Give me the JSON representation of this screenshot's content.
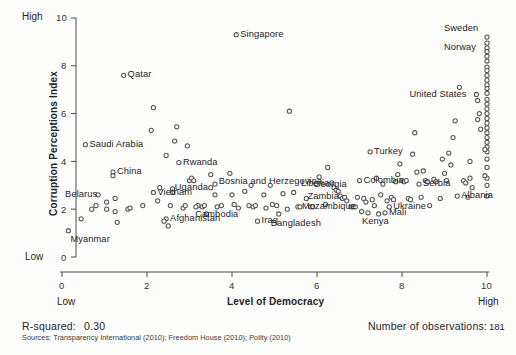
{
  "chart_data": {
    "type": "scatter",
    "title": "",
    "xlabel": "Level of Democracy",
    "ylabel": "Corruption Perceptions Index",
    "xlim": [
      0,
      10
    ],
    "ylim": [
      0,
      10
    ],
    "xticks": [
      "0",
      "2",
      "4",
      "6",
      "8",
      "10"
    ],
    "yticks": [
      "0",
      "2",
      "4",
      "6",
      "8",
      "10"
    ],
    "x_low_label": "Low",
    "x_high_label": "High",
    "y_low_label": "Low",
    "y_high_label": "High",
    "grid": false,
    "legend": "none",
    "r_squared": "0.30",
    "n_observations": "181",
    "points": [
      {
        "x": 0.15,
        "y": 1.1,
        "label": "Myanmar",
        "label_pos": "below-right"
      },
      {
        "x": 0.45,
        "y": 1.6,
        "label": ""
      },
      {
        "x": 0.55,
        "y": 4.7,
        "label": "Saudi Arabia",
        "label_pos": "right"
      },
      {
        "x": 0.85,
        "y": 2.6,
        "label": "Belarus",
        "label_pos": "below-left"
      },
      {
        "x": 0.8,
        "y": 2.15,
        "label": ""
      },
      {
        "x": 0.7,
        "y": 2.0,
        "label": ""
      },
      {
        "x": 1.05,
        "y": 2.3,
        "label": ""
      },
      {
        "x": 1.05,
        "y": 2.0,
        "label": ""
      },
      {
        "x": 1.2,
        "y": 3.55,
        "label": "China",
        "label_pos": "right"
      },
      {
        "x": 1.2,
        "y": 3.4,
        "label": ""
      },
      {
        "x": 1.25,
        "y": 2.45,
        "label": ""
      },
      {
        "x": 1.25,
        "y": 1.9,
        "label": ""
      },
      {
        "x": 1.3,
        "y": 1.45,
        "label": ""
      },
      {
        "x": 1.45,
        "y": 7.6,
        "label": "Qatar",
        "label_pos": "right"
      },
      {
        "x": 1.55,
        "y": 2.0,
        "label": ""
      },
      {
        "x": 1.6,
        "y": 2.05,
        "label": ""
      },
      {
        "x": 1.9,
        "y": 2.15,
        "label": ""
      },
      {
        "x": 2.15,
        "y": 6.25,
        "label": ""
      },
      {
        "x": 2.1,
        "y": 5.3,
        "label": ""
      },
      {
        "x": 2.15,
        "y": 2.7,
        "label": "Vietnam",
        "label_pos": "right"
      },
      {
        "x": 2.25,
        "y": 2.35,
        "label": ""
      },
      {
        "x": 2.45,
        "y": 1.6,
        "label": "Afghanistan",
        "label_pos": "right"
      },
      {
        "x": 2.4,
        "y": 1.5,
        "label": ""
      },
      {
        "x": 2.5,
        "y": 1.3,
        "label": ""
      },
      {
        "x": 2.55,
        "y": 2.15,
        "label": ""
      },
      {
        "x": 2.6,
        "y": 2.85,
        "label": ""
      },
      {
        "x": 2.6,
        "y": 2.7,
        "label": ""
      },
      {
        "x": 2.45,
        "y": 4.25,
        "label": ""
      },
      {
        "x": 2.65,
        "y": 4.85,
        "label": ""
      },
      {
        "x": 2.7,
        "y": 5.45,
        "label": ""
      },
      {
        "x": 2.75,
        "y": 3.95,
        "label": "Rwanda",
        "label_pos": "right"
      },
      {
        "x": 2.85,
        "y": 2.05,
        "label": ""
      },
      {
        "x": 2.9,
        "y": 2.15,
        "label": ""
      },
      {
        "x": 2.95,
        "y": 4.65,
        "label": ""
      },
      {
        "x": 3.0,
        "y": 3.2,
        "label": ""
      },
      {
        "x": 3.05,
        "y": 3.3,
        "label": ""
      },
      {
        "x": 3.1,
        "y": 3.2,
        "label": ""
      },
      {
        "x": 3.2,
        "y": 2.15,
        "label": ""
      },
      {
        "x": 3.15,
        "y": 2.1,
        "label": ""
      },
      {
        "x": 3.3,
        "y": 2.1,
        "label": "Cambodia",
        "label_pos": "below"
      },
      {
        "x": 3.35,
        "y": 2.15,
        "label": ""
      },
      {
        "x": 3.4,
        "y": 1.8,
        "label": ""
      },
      {
        "x": 3.5,
        "y": 2.9,
        "label": "Uganda",
        "label_pos": "left"
      },
      {
        "x": 3.6,
        "y": 3.05,
        "label": ""
      },
      {
        "x": 3.6,
        "y": 2.6,
        "label": ""
      },
      {
        "x": 3.65,
        "y": 2.1,
        "label": ""
      },
      {
        "x": 3.75,
        "y": 2.15,
        "label": ""
      },
      {
        "x": 4.1,
        "y": 9.3,
        "label": "Singapore",
        "label_pos": "right"
      },
      {
        "x": 3.95,
        "y": 3.5,
        "label": ""
      },
      {
        "x": 3.5,
        "y": 3.45,
        "label": "Bosnia and Herzegovina",
        "label_pos": "right-far"
      },
      {
        "x": 4.0,
        "y": 2.6,
        "label": ""
      },
      {
        "x": 4.05,
        "y": 2.2,
        "label": ""
      },
      {
        "x": 4.15,
        "y": 2.05,
        "label": ""
      },
      {
        "x": 4.3,
        "y": 2.75,
        "label": ""
      },
      {
        "x": 4.4,
        "y": 2.15,
        "label": ""
      },
      {
        "x": 4.5,
        "y": 2.1,
        "label": ""
      },
      {
        "x": 4.55,
        "y": 2.15,
        "label": ""
      },
      {
        "x": 4.6,
        "y": 1.5,
        "label": "Iraq",
        "label_pos": "right"
      },
      {
        "x": 4.75,
        "y": 2.6,
        "label": ""
      },
      {
        "x": 4.8,
        "y": 2.05,
        "label": ""
      },
      {
        "x": 4.95,
        "y": 2.2,
        "label": ""
      },
      {
        "x": 5.05,
        "y": 2.15,
        "label": ""
      },
      {
        "x": 5.1,
        "y": 1.8,
        "label": "Bangladesh",
        "label_pos": "below-right"
      },
      {
        "x": 5.2,
        "y": 2.65,
        "label": ""
      },
      {
        "x": 5.35,
        "y": 6.1,
        "label": ""
      },
      {
        "x": 5.45,
        "y": 2.7,
        "label": ""
      },
      {
        "x": 5.55,
        "y": 2.1,
        "label": "Mozambique",
        "label_pos": "right"
      },
      {
        "x": 5.6,
        "y": 2.1,
        "label": ""
      },
      {
        "x": 5.85,
        "y": 2.1,
        "label": ""
      },
      {
        "x": 5.9,
        "y": 2.1,
        "label": ""
      },
      {
        "x": 6.05,
        "y": 3.35,
        "label": "Georgia",
        "label_pos": "below-left"
      },
      {
        "x": 6.25,
        "y": 3.75,
        "label": ""
      },
      {
        "x": 6.35,
        "y": 3.1,
        "label": "Liberia",
        "label_pos": "left"
      },
      {
        "x": 6.4,
        "y": 2.9,
        "label": ""
      },
      {
        "x": 6.45,
        "y": 2.8,
        "label": ""
      },
      {
        "x": 6.5,
        "y": 2.75,
        "label": ""
      },
      {
        "x": 6.55,
        "y": 2.55,
        "label": "Zambia",
        "label_pos": "left"
      },
      {
        "x": 6.6,
        "y": 2.45,
        "label": ""
      },
      {
        "x": 6.65,
        "y": 2.5,
        "label": ""
      },
      {
        "x": 6.7,
        "y": 2.35,
        "label": ""
      },
      {
        "x": 6.8,
        "y": 2.1,
        "label": ""
      },
      {
        "x": 6.85,
        "y": 2.1,
        "label": ""
      },
      {
        "x": 6.9,
        "y": 2.1,
        "label": ""
      },
      {
        "x": 7.0,
        "y": 3.2,
        "label": "Colombia",
        "label_pos": "right"
      },
      {
        "x": 6.95,
        "y": 2.5,
        "label": ""
      },
      {
        "x": 7.1,
        "y": 2.45,
        "label": ""
      },
      {
        "x": 7.05,
        "y": 1.9,
        "label": ""
      },
      {
        "x": 7.15,
        "y": 2.3,
        "label": ""
      },
      {
        "x": 7.2,
        "y": 1.85,
        "label": "Kenya",
        "label_pos": "below"
      },
      {
        "x": 7.25,
        "y": 4.4,
        "label": "Turkey",
        "label_pos": "right"
      },
      {
        "x": 7.3,
        "y": 2.4,
        "label": ""
      },
      {
        "x": 7.35,
        "y": 2.15,
        "label": ""
      },
      {
        "x": 7.45,
        "y": 1.8,
        "label": ""
      },
      {
        "x": 7.5,
        "y": 2.6,
        "label": ""
      },
      {
        "x": 7.55,
        "y": 3.05,
        "label": ""
      },
      {
        "x": 7.6,
        "y": 1.85,
        "label": "Mali",
        "label_pos": "right"
      },
      {
        "x": 7.65,
        "y": 2.35,
        "label": ""
      },
      {
        "x": 7.7,
        "y": 2.1,
        "label": "Ukraine",
        "label_pos": "right"
      },
      {
        "x": 7.75,
        "y": 2.5,
        "label": ""
      },
      {
        "x": 7.8,
        "y": 2.4,
        "label": ""
      },
      {
        "x": 7.85,
        "y": 3.15,
        "label": ""
      },
      {
        "x": 7.9,
        "y": 3.45,
        "label": ""
      },
      {
        "x": 7.95,
        "y": 3.9,
        "label": ""
      },
      {
        "x": 8.0,
        "y": 3.2,
        "label": ""
      },
      {
        "x": 8.05,
        "y": 3.15,
        "label": ""
      },
      {
        "x": 8.1,
        "y": 3.2,
        "label": ""
      },
      {
        "x": 8.15,
        "y": 2.45,
        "label": ""
      },
      {
        "x": 8.2,
        "y": 2.4,
        "label": ""
      },
      {
        "x": 8.3,
        "y": 5.2,
        "label": ""
      },
      {
        "x": 8.35,
        "y": 3.55,
        "label": ""
      },
      {
        "x": 8.4,
        "y": 3.05,
        "label": "Serbia",
        "label_pos": "right"
      },
      {
        "x": 8.45,
        "y": 2.5,
        "label": ""
      },
      {
        "x": 8.5,
        "y": 3.6,
        "label": ""
      },
      {
        "x": 8.55,
        "y": 3.2,
        "label": ""
      },
      {
        "x": 8.6,
        "y": 3.15,
        "label": ""
      },
      {
        "x": 8.75,
        "y": 3.25,
        "label": ""
      },
      {
        "x": 8.8,
        "y": 3.15,
        "label": ""
      },
      {
        "x": 8.9,
        "y": 2.45,
        "label": ""
      },
      {
        "x": 9.0,
        "y": 3.5,
        "label": ""
      },
      {
        "x": 9.05,
        "y": 3.2,
        "label": ""
      },
      {
        "x": 9.1,
        "y": 4.35,
        "label": ""
      },
      {
        "x": 9.15,
        "y": 3.85,
        "label": ""
      },
      {
        "x": 9.2,
        "y": 5.0,
        "label": ""
      },
      {
        "x": 9.25,
        "y": 5.7,
        "label": ""
      },
      {
        "x": 9.35,
        "y": 7.1,
        "label": ""
      },
      {
        "x": 9.3,
        "y": 2.55,
        "label": "Albania",
        "label_pos": "left"
      },
      {
        "x": 9.45,
        "y": 3.2,
        "label": ""
      },
      {
        "x": 9.5,
        "y": 3.1,
        "label": ""
      },
      {
        "x": 9.55,
        "y": 2.5,
        "label": ""
      },
      {
        "x": 9.75,
        "y": 6.8,
        "label": "United States",
        "label_pos": "left"
      },
      {
        "x": 9.78,
        "y": 6.55,
        "label": ""
      },
      {
        "x": 9.82,
        "y": 6.0,
        "label": ""
      },
      {
        "x": 9.78,
        "y": 5.75,
        "label": ""
      },
      {
        "x": 9.85,
        "y": 5.35,
        "label": ""
      },
      {
        "x": 10.0,
        "y": 9.2,
        "label": "Sweden",
        "label_pos": "above-left"
      },
      {
        "x": 10.0,
        "y": 8.95,
        "label": ""
      },
      {
        "x": 10.0,
        "y": 8.75,
        "label": "Norway",
        "label_pos": "left"
      },
      {
        "x": 10.0,
        "y": 8.6,
        "label": ""
      },
      {
        "x": 10.0,
        "y": 8.4,
        "label": ""
      },
      {
        "x": 10.0,
        "y": 8.2,
        "label": ""
      },
      {
        "x": 10.0,
        "y": 7.95,
        "label": ""
      },
      {
        "x": 10.0,
        "y": 7.8,
        "label": ""
      },
      {
        "x": 10.0,
        "y": 7.6,
        "label": ""
      },
      {
        "x": 10.0,
        "y": 7.4,
        "label": ""
      },
      {
        "x": 10.0,
        "y": 7.2,
        "label": ""
      },
      {
        "x": 10.0,
        "y": 7.05,
        "label": ""
      },
      {
        "x": 10.0,
        "y": 6.85,
        "label": ""
      },
      {
        "x": 10.0,
        "y": 6.6,
        "label": ""
      },
      {
        "x": 10.0,
        "y": 6.4,
        "label": ""
      },
      {
        "x": 10.0,
        "y": 6.2,
        "label": ""
      },
      {
        "x": 10.0,
        "y": 6.0,
        "label": ""
      },
      {
        "x": 10.0,
        "y": 5.8,
        "label": ""
      },
      {
        "x": 10.0,
        "y": 5.6,
        "label": ""
      },
      {
        "x": 10.0,
        "y": 5.4,
        "label": ""
      },
      {
        "x": 10.0,
        "y": 5.2,
        "label": ""
      },
      {
        "x": 10.0,
        "y": 5.0,
        "label": ""
      },
      {
        "x": 10.0,
        "y": 4.8,
        "label": ""
      },
      {
        "x": 10.0,
        "y": 4.6,
        "label": ""
      },
      {
        "x": 10.0,
        "y": 4.4,
        "label": ""
      },
      {
        "x": 10.0,
        "y": 4.1,
        "label": ""
      },
      {
        "x": 10.0,
        "y": 3.75,
        "label": ""
      },
      {
        "x": 10.0,
        "y": 3.3,
        "label": ""
      },
      {
        "x": 10.0,
        "y": 3.0,
        "label": ""
      },
      {
        "x": 10.0,
        "y": 2.55,
        "label": ""
      },
      {
        "x": 9.95,
        "y": 4.5,
        "label": ""
      },
      {
        "x": 9.95,
        "y": 3.4,
        "label": ""
      },
      {
        "x": 9.6,
        "y": 4.0,
        "label": ""
      },
      {
        "x": 9.6,
        "y": 3.3,
        "label": ""
      },
      {
        "x": 9.65,
        "y": 2.9,
        "label": ""
      },
      {
        "x": 8.95,
        "y": 4.1,
        "label": ""
      },
      {
        "x": 8.25,
        "y": 4.3,
        "label": ""
      },
      {
        "x": 7.4,
        "y": 3.3,
        "label": ""
      },
      {
        "x": 6.2,
        "y": 2.2,
        "label": ""
      },
      {
        "x": 5.75,
        "y": 2.45,
        "label": ""
      },
      {
        "x": 4.9,
        "y": 3.0,
        "label": ""
      },
      {
        "x": 4.45,
        "y": 3.0,
        "label": ""
      },
      {
        "x": 5.3,
        "y": 2.0,
        "label": ""
      },
      {
        "x": 8.65,
        "y": 2.15,
        "label": ""
      },
      {
        "x": 2.3,
        "y": 2.9,
        "label": ""
      }
    ]
  },
  "footer": {
    "rsquared_label": "R-squared:",
    "rsquared_value": "0.30",
    "sources": "Sources: Transparency International (2010); Freedom House (2010); Polity (2010)",
    "observations_label": "Number of observations:",
    "observations_value": "181"
  }
}
